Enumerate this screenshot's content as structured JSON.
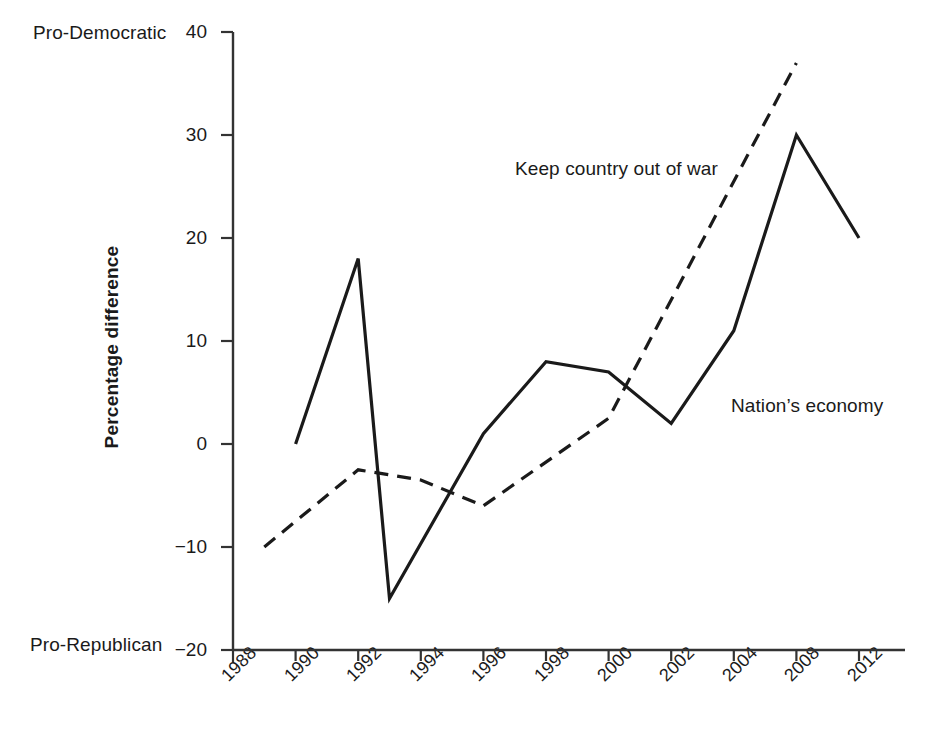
{
  "chart_data": {
    "type": "line",
    "title": "",
    "xlabel": "",
    "ylabel": "Percentage difference",
    "ylim": [
      -20,
      40
    ],
    "yticks": [
      40,
      30,
      20,
      10,
      0,
      -10,
      -20
    ],
    "ytick_labels": [
      "40",
      "30",
      "20",
      "10",
      "0",
      "−10",
      "−20"
    ],
    "categories": [
      "1988",
      "1990",
      "1992",
      "1994",
      "1996",
      "1998",
      "2000",
      "2002",
      "2004",
      "2008",
      "2012"
    ],
    "grid": false,
    "legend_position": "inline-annotations",
    "axis_end_labels": {
      "top": "Pro-Democratic",
      "bottom": "Pro-Republican"
    },
    "series": [
      {
        "name": "Nation's economy",
        "style": "solid",
        "color": "#1a1a1a",
        "annotation": "Nation’s economy",
        "points": [
          {
            "x": "1990",
            "y": 0
          },
          {
            "x": "1992",
            "y": 18
          },
          {
            "x": "1993",
            "y": -15
          },
          {
            "x": "1996",
            "y": 1
          },
          {
            "x": "1998",
            "y": 8
          },
          {
            "x": "2000",
            "y": 7
          },
          {
            "x": "2002",
            "y": 2
          },
          {
            "x": "2004",
            "y": 11
          },
          {
            "x": "2008",
            "y": 30
          },
          {
            "x": "2012",
            "y": 20
          }
        ]
      },
      {
        "name": "Keep country out of war",
        "style": "dashed",
        "color": "#1a1a1a",
        "annotation": "Keep country out of war",
        "points": [
          {
            "x": "1989",
            "y": -10
          },
          {
            "x": "1992",
            "y": -2.5
          },
          {
            "x": "1994",
            "y": -3.5
          },
          {
            "x": "1996",
            "y": -6
          },
          {
            "x": "2000",
            "y": 2.5
          },
          {
            "x": "2008",
            "y": 37
          }
        ]
      }
    ]
  },
  "axis": {
    "y_title": "Percentage difference",
    "top_label": "Pro-Democratic",
    "bottom_label": "Pro-Republican"
  },
  "annotations": {
    "war": "Keep country out of war",
    "economy": "Nation’s economy"
  }
}
